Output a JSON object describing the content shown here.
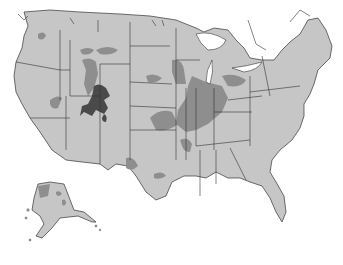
{
  "map": {
    "type": "choropleth-style shaded map",
    "subject": "United States (contiguous 48 states plus Alaska inset)",
    "legend": null,
    "title": null,
    "colors": {
      "background": "#ffffff",
      "base_fill": "#c6c6c6",
      "medium_shade": "#8e8e8e",
      "dark_shade": "#4a4a4a",
      "borders": "#333333"
    },
    "shading_levels": [
      "light (base)",
      "medium",
      "dark"
    ],
    "highlighted_regions": [
      {
        "area": "Wyoming / Colorado / Utah (central Rockies)",
        "level": "dark"
      },
      {
        "area": "Idaho / Wyoming / Montana",
        "level": "medium"
      },
      {
        "area": "Illinois, Indiana, Ohio, Kentucky, West Virginia, Michigan lower peninsula",
        "level": "medium"
      },
      {
        "area": "Missouri / Kansas border",
        "level": "medium"
      },
      {
        "area": "Pennsylvania / New York",
        "level": "medium"
      },
      {
        "area": "Tennessee / Alabama",
        "level": "medium"
      },
      {
        "area": "Texas",
        "level": "medium"
      },
      {
        "area": "South Dakota",
        "level": "medium"
      },
      {
        "area": "Nevada",
        "level": "medium"
      },
      {
        "area": "Washington",
        "level": "medium"
      },
      {
        "area": "Alaska north-west",
        "level": "medium"
      }
    ]
  }
}
